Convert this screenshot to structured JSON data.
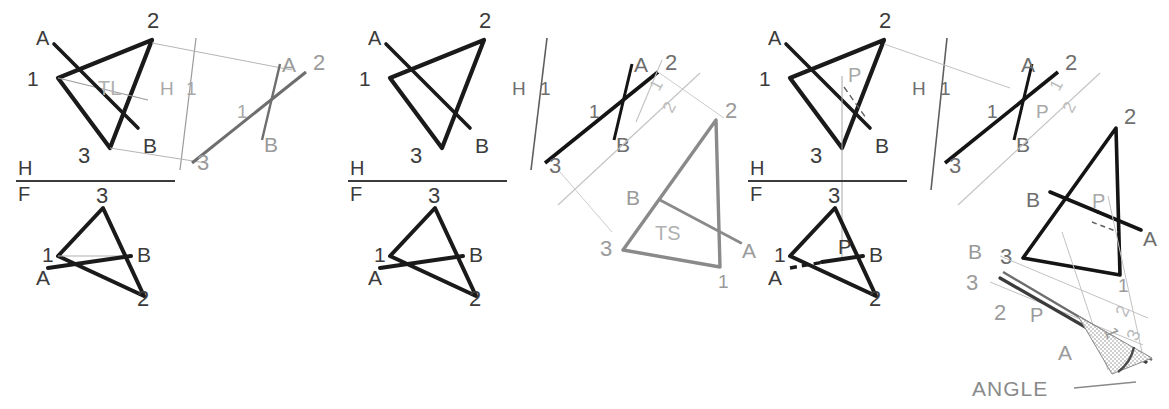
{
  "sheet": {
    "background": "#ffffff",
    "ink_dark": "#1a1a1a",
    "ink_mid": "#4a4a4a",
    "ink_gray": "#8a8a8a",
    "ink_light": "#b8b8b8",
    "cut_off_header": ""
  },
  "panels": [
    {
      "id": "panel-1",
      "caption_tl": "TL",
      "fold_hf_top": "H",
      "fold_hf_bottom": "F",
      "fold_h1_left": "H",
      "fold_h1_right": "1",
      "top_view": {
        "vertices": [
          "2",
          "1",
          "3"
        ],
        "line_end_a": "A",
        "line_end_b": "B"
      },
      "front_view": {
        "vertices": [
          "3",
          "1",
          "2"
        ],
        "line_end_a": "A",
        "line_end_b": "B"
      },
      "aux_view": {
        "labels": [
          "3",
          "A",
          "2",
          "B",
          "1"
        ]
      }
    },
    {
      "id": "panel-2",
      "caption_ts": "TS",
      "fold_hf_top": "H",
      "fold_hf_bottom": "F",
      "fold_h1_left": "H",
      "fold_h1_right": "1",
      "fold_12_left": "1",
      "fold_12_right": "2",
      "top_view": {
        "vertices": [
          "2",
          "1",
          "3"
        ],
        "line_end_a": "A",
        "line_end_b": "B"
      },
      "front_view": {
        "vertices": [
          "3",
          "1",
          "2"
        ],
        "line_end_a": "A",
        "line_end_b": "B"
      },
      "aux_view": {
        "labels": [
          "3",
          "A",
          "2",
          "B",
          "1"
        ]
      },
      "ts_view": {
        "vertices": [
          "2",
          "3",
          "1"
        ],
        "line_end_a": "A",
        "line_end_b": "B"
      }
    },
    {
      "id": "panel-3",
      "caption_angle": "ANGLE",
      "point_p": "P",
      "fold_hf_top": "H",
      "fold_hf_bottom": "F",
      "fold_h1_left": "H",
      "fold_h1_right": "1",
      "fold_12_left": "1",
      "fold_12_right": "2",
      "fold_23_left": "2",
      "fold_23_right": "3",
      "top_view": {
        "vertices": [
          "2",
          "1",
          "3"
        ],
        "line_end_a": "A",
        "line_end_b": "B",
        "pierce": "P"
      },
      "front_view": {
        "vertices": [
          "3",
          "1",
          "2"
        ],
        "line_end_a": "A",
        "line_end_b": "B",
        "pierce": "P"
      },
      "aux_view": {
        "labels": [
          "3",
          "A",
          "2",
          "B",
          "1"
        ],
        "pierce": "P"
      },
      "ts_view": {
        "vertices": [
          "2",
          "3",
          "1"
        ],
        "line_end_a": "A",
        "line_end_b": "B",
        "pierce": "P"
      },
      "angle_view": {
        "labels": [
          "B",
          "3",
          "2",
          "A",
          "1"
        ],
        "pierce": "P",
        "callout": "ANGLE"
      }
    }
  ]
}
